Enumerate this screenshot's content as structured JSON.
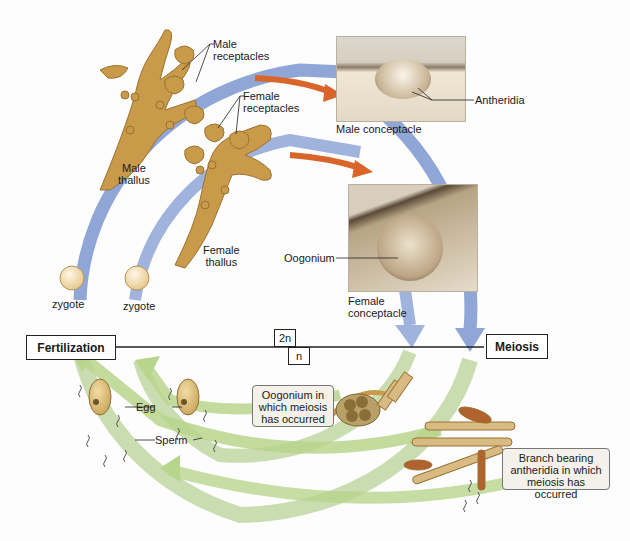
{
  "diagram": {
    "colors": {
      "outer_cycle": "#8fa6d6",
      "inner_cycle": "#9fb3dc",
      "arrow_accent": "#d9652b",
      "gamete_arrows": "#b8d58c",
      "thallus": "#c89a4a",
      "callout_bg": "#f3f1ea"
    },
    "phases": {
      "left": "Fertilization",
      "right": "Meiosis",
      "diploid": "2n",
      "haploid": "n"
    },
    "structures": {
      "male_receptacles": "Male\nreceptacles",
      "female_receptacles": "Female\nreceptacles",
      "male_thallus": "Male\nthallus",
      "female_thallus": "Female\nthallus",
      "antheridia": "Antheridia",
      "male_conceptacle": "Male conceptacle",
      "oogonium": "Oogonium",
      "female_conceptacle": "Female\nconceptacle",
      "zygote_1": "zygote",
      "zygote_2": "zygote",
      "egg": "Egg",
      "sperm": "Sperm"
    },
    "callouts": {
      "oogonium_meiosis": "Oogonium in\nwhich meiosis\nhas occurred",
      "antheridia_branch": "Branch bearing\nantheridia in which\nmeiosis has occurred"
    }
  }
}
